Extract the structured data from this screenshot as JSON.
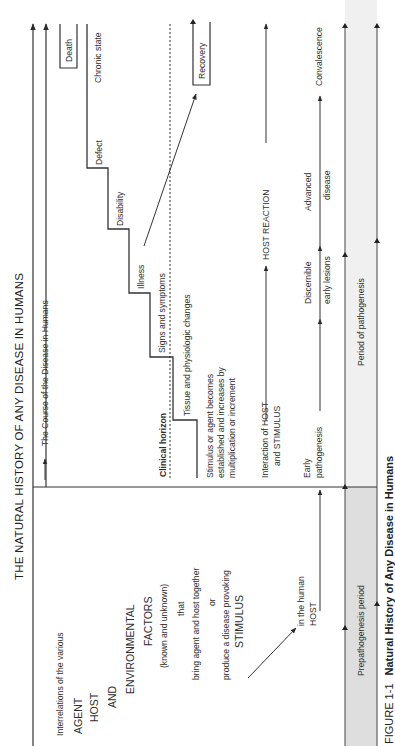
{
  "figure": {
    "title": "THE NATURAL HISTORY OF ANY DISEASE IN HUMANS",
    "caption_label": "FIGURE 1-1",
    "caption_text": "Natural History of Any Disease in Humans"
  },
  "prepathogenesis": {
    "intro": "Interrelations of the various",
    "agent": "AGENT",
    "host": "HOST",
    "and": "AND",
    "environmental": "ENVIRONMENTAL",
    "factors": "FACTORS",
    "known": "(known and unknown)",
    "that": "that",
    "bring": "bring agent and host together",
    "or": "or",
    "produce": "produce a disease provoking",
    "stimulus": "STIMULUS",
    "in_human": "in the human",
    "host_label": "HOST"
  },
  "pathogenesis": {
    "course": "The Course of the Disease in Humans",
    "clinical_horizon": "Clinical horizon",
    "stimulus_line1": "Stimulus or agent becomes",
    "stimulus_line2": "established and increases by",
    "stimulus_line3": "multiplication or increment",
    "stages": [
      {
        "label": "Tissue and physiologic changes"
      },
      {
        "label": "Signs and symptoms"
      },
      {
        "label": "Illness"
      },
      {
        "label": "Disability"
      },
      {
        "label": "Defect"
      },
      {
        "label": "Chronic state"
      }
    ],
    "death": "Death",
    "recovery": "Recovery",
    "interaction_line1": "Interaction of HOST",
    "interaction_line2": "and STIMULUS",
    "host_reaction": "HOST REACTION",
    "early_line1": "Early",
    "early_line2": "pathogenesis",
    "discernible_line1": "Discernible",
    "discernible_line2": "early lesions",
    "advanced_line1": "Advanced",
    "advanced_line2": "disease",
    "convalescence": "Convalescence"
  },
  "periods": {
    "prepathogenesis": "Prepathogenesis period",
    "pathogenesis": "Period of pathogenesis"
  },
  "colors": {
    "line": "#3a3a3a",
    "band": "#dcdcdc"
  }
}
